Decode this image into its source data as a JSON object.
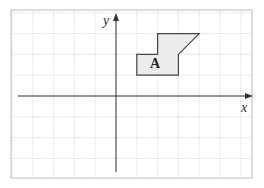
{
  "diagram": {
    "type": "coordinate-grid",
    "grid": {
      "columns": 11.5,
      "rows": 8,
      "unit_px": 20.8,
      "origin_px": [
        116,
        96
      ],
      "line_color": "#d0d0d0",
      "border_color": "#bdbdbd"
    },
    "axes": {
      "x_label": "x",
      "y_label": "y",
      "color": "#333333"
    },
    "shape": {
      "label": "A",
      "fill": "#ececec",
      "stroke": "#444444",
      "vertices": [
        [
          1,
          1
        ],
        [
          1,
          2
        ],
        [
          2,
          2
        ],
        [
          2,
          3
        ],
        [
          4,
          3
        ],
        [
          3,
          2
        ],
        [
          3,
          1
        ]
      ]
    }
  }
}
